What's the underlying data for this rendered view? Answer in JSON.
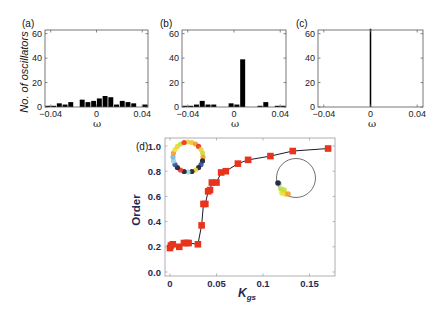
{
  "chart_data": [
    {
      "panel": "(a)",
      "type": "bar",
      "title": "",
      "xlabel": "ω",
      "ylabel": "No. of oscillators",
      "xlim": [
        -0.045,
        0.045
      ],
      "ylim": [
        0,
        63
      ],
      "xticks": [
        -0.04,
        0,
        0.04
      ],
      "xtick_labels": [
        "−0.04",
        "0",
        "0.04"
      ],
      "yticks": [
        0,
        20,
        40,
        60
      ],
      "ytick_labels": [
        "0",
        "20",
        "40",
        "60"
      ],
      "bin_width": 0.005,
      "x": [
        -0.0425,
        -0.0375,
        -0.0325,
        -0.0275,
        -0.0225,
        -0.0175,
        -0.0125,
        -0.0075,
        -0.0025,
        0.0025,
        0.0075,
        0.0125,
        0.0175,
        0.0225,
        0.0275,
        0.0325,
        0.0375,
        0.0425
      ],
      "values": [
        1,
        1,
        3,
        2,
        4,
        0,
        6,
        4,
        5,
        7,
        9,
        8,
        2,
        5,
        4,
        3,
        0,
        2
      ],
      "grid": false
    },
    {
      "panel": "(b)",
      "type": "bar",
      "title": "",
      "xlabel": "ω",
      "ylabel": "",
      "xlim": [
        -0.045,
        0.045
      ],
      "ylim": [
        0,
        63
      ],
      "xticks": [
        -0.04,
        0,
        0.04
      ],
      "xtick_labels": [
        "−0.04",
        "0",
        "0.04"
      ],
      "yticks": [
        0,
        20,
        40,
        60
      ],
      "ytick_labels": [
        "0",
        "20",
        "40",
        "60"
      ],
      "bin_width": 0.005,
      "x": [
        -0.0425,
        -0.0375,
        -0.0325,
        -0.0275,
        -0.0225,
        -0.0175,
        -0.0125,
        -0.0075,
        -0.0025,
        0.0025,
        0.0075,
        0.0125,
        0.0175,
        0.0225,
        0.0275,
        0.0325,
        0.0375,
        0.0425
      ],
      "values": [
        1,
        1,
        2,
        5,
        2,
        2,
        0,
        0,
        3,
        2,
        39,
        0,
        0,
        1,
        4,
        0,
        1,
        1
      ],
      "grid": false
    },
    {
      "panel": "(c)",
      "type": "bar",
      "title": "",
      "xlabel": "ω",
      "ylabel": "",
      "xlim": [
        -0.045,
        0.045
      ],
      "ylim": [
        0,
        63
      ],
      "xticks": [
        -0.04,
        0,
        0.04
      ],
      "xtick_labels": [
        "−0.04",
        "0",
        "0.04"
      ],
      "yticks": [
        0,
        20,
        40,
        60
      ],
      "ytick_labels": [
        "0",
        "20",
        "40",
        "60"
      ],
      "bin_width": 0.002,
      "x": [
        0.0
      ],
      "values": [
        64
      ],
      "grid": false
    },
    {
      "panel": "(d)",
      "type": "line",
      "title": "",
      "xlabel": "K",
      "xlabel_subscript": "gs",
      "ylabel": "Order",
      "xlim": [
        -0.005,
        0.175
      ],
      "ylim": [
        0,
        1.07
      ],
      "xticks": [
        0,
        0.05,
        0.1,
        0.15
      ],
      "xtick_labels": [
        "0",
        "0.05",
        "0.1",
        "0.15"
      ],
      "yticks": [
        0,
        0.2,
        0.4,
        0.6,
        0.8,
        1.0
      ],
      "ytick_labels": [
        "0.0",
        "0.2",
        "0.4",
        "0.6",
        "0.8",
        "1.0"
      ],
      "series": [
        {
          "name": "Order parameter",
          "marker": "square",
          "marker_color": "#e8341c",
          "line_color": "#1a1a2e",
          "x": [
            0.0,
            0.001,
            0.003,
            0.01,
            0.015,
            0.018,
            0.02,
            0.03,
            0.034,
            0.036,
            0.038,
            0.041,
            0.043,
            0.045,
            0.05,
            0.055,
            0.06,
            0.073,
            0.084,
            0.108,
            0.132,
            0.17
          ],
          "values": [
            0.19,
            0.21,
            0.22,
            0.2,
            0.23,
            0.23,
            0.23,
            0.22,
            0.37,
            0.54,
            0.54,
            0.64,
            0.65,
            0.71,
            0.71,
            0.79,
            0.8,
            0.86,
            0.89,
            0.92,
            0.96,
            0.98
          ]
        }
      ],
      "insets": [
        {
          "name": "incoherent-phase-ring",
          "description": "oscillators spread uniformly around unit circle",
          "colors": [
            "#f0d23a",
            "#f39c2b",
            "#e8341c",
            "#9ad3e6",
            "#1b1b2a",
            "#2c4f9e",
            "#c9dc3b",
            "#7fb6d8"
          ]
        },
        {
          "name": "synchronized-phase-ring",
          "description": "oscillators clustered at one side of unit circle",
          "colors": [
            "#1b1b2a",
            "#9ad3e6",
            "#c9dc3b",
            "#e8e43a",
            "#f39c2b"
          ]
        }
      ],
      "grid": false
    }
  ],
  "labels": {
    "panel_a": "(a)",
    "panel_b": "(b)",
    "panel_c": "(c)",
    "panel_d": "(d)",
    "hist_ylabel": "No. of oscillators",
    "omega": "ω",
    "order": "Order",
    "k": "K",
    "k_sub": "gs"
  },
  "colors": {
    "bar": "#000000",
    "marker": "#e8341c",
    "line": "#1a1a2e",
    "axis_text_d": "#1f2a55"
  }
}
